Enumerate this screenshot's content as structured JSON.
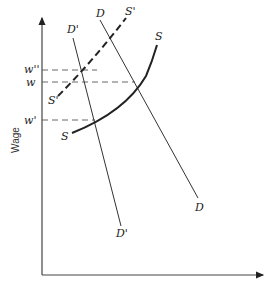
{
  "diagram": {
    "type": "labor supply and demand shift",
    "y_axis_label": "Wage",
    "x_axis_label": "",
    "wage_levels": [
      {
        "id": "w_double_prime",
        "label": "w''"
      },
      {
        "id": "w",
        "label": "w"
      },
      {
        "id": "w_prime",
        "label": "w'"
      }
    ],
    "curves": {
      "S": {
        "label_top": "S",
        "label_bottom": "S",
        "style": "solid-bold"
      },
      "S_prime": {
        "label_top": "S'",
        "label_bottom": "S'",
        "style": "dashed-bold"
      },
      "D": {
        "label_top": "D",
        "label_bottom": "D",
        "style": "solid-thin"
      },
      "D_prime": {
        "label_top": "D'",
        "label_bottom": "D'",
        "style": "solid-thin"
      }
    },
    "equilibria": [
      {
        "curves": [
          "S",
          "D"
        ],
        "wage": "w"
      },
      {
        "curves": [
          "S",
          "D'"
        ],
        "wage": "w'"
      },
      {
        "curves": [
          "S'",
          "D'"
        ],
        "wage": "w''"
      }
    ],
    "colors": {
      "ink": "#222222",
      "dashed_guides": "#555555"
    }
  }
}
